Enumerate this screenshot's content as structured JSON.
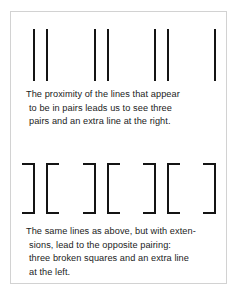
{
  "figure": {
    "kind": "gestalt-proximity-illustration",
    "frame_color": "#d2d2d2",
    "ink_color": "#141414",
    "background_color": "#ffffff"
  },
  "panels": {
    "top": {
      "name": "plain-lines-panel",
      "element_count": 7,
      "perceived_groups": "three pairs and one extra line at the right",
      "elements": [
        {
          "type": "line",
          "x": 33
        },
        {
          "type": "line",
          "x": 46
        },
        {
          "type": "line",
          "x": 94
        },
        {
          "type": "line",
          "x": 107
        },
        {
          "type": "line",
          "x": 154
        },
        {
          "type": "line",
          "x": 167
        },
        {
          "type": "line",
          "x": 214
        }
      ]
    },
    "bottom": {
      "name": "bracketed-lines-panel",
      "element_count": 7,
      "perceived_groups": "three broken squares and one extra line at the left",
      "elements": [
        {
          "type": "bracket",
          "orientation": "close",
          "glyph": "]",
          "x": 33
        },
        {
          "type": "bracket",
          "orientation": "open",
          "glyph": "[",
          "x": 46
        },
        {
          "type": "bracket",
          "orientation": "close",
          "glyph": "]",
          "x": 94
        },
        {
          "type": "bracket",
          "orientation": "open",
          "glyph": "[",
          "x": 107
        },
        {
          "type": "bracket",
          "orientation": "close",
          "glyph": "]",
          "x": 154
        },
        {
          "type": "bracket",
          "orientation": "open",
          "glyph": "[",
          "x": 167
        },
        {
          "type": "bracket",
          "orientation": "close",
          "glyph": "]",
          "x": 214
        }
      ]
    }
  },
  "captions": {
    "top": [
      "The proximity of the lines that appear",
      "to be in pairs leads us to see three",
      "pairs and an extra line at the right."
    ],
    "bottom": [
      "The same lines as above, but with exten-",
      "sions, lead to the opposite pairing:",
      "three broken squares and an extra line",
      "at the left."
    ]
  }
}
